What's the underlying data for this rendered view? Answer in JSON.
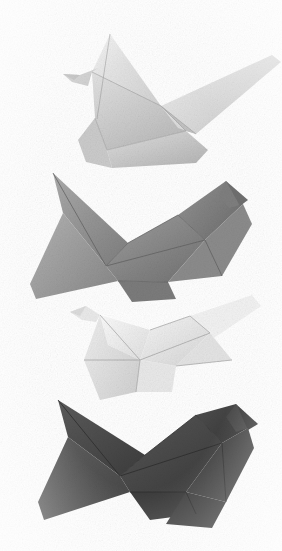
{
  "image": {
    "title": "Four origami paper cranes",
    "subject": "origami-cranes",
    "background_color": "#ffffff",
    "width": 282,
    "height": 551,
    "style": "grainy halftone photographic illustration, grayscale"
  },
  "palette": {
    "background": "#ffffff",
    "crane_light_body": "#d9d9d9",
    "crane_light_shade": "#bdbdbd",
    "crane_light_highlight": "#efefef",
    "crane_mid_body": "#9a9a9a",
    "crane_mid_shade": "#787878",
    "crane_mid_highlight": "#b8b8b8",
    "crane_pale_body": "#f0f0f0",
    "crane_pale_shade": "#d4d4d4",
    "crane_pale_highlight": "#fafafa",
    "crane_dark_body": "#4f4f4f",
    "crane_dark_shade": "#3a3a3a",
    "crane_dark_highlight": "#636363",
    "edge_line": "#8a8a8a",
    "edge_line_dark": "#2e2e2e"
  },
  "cranes": [
    {
      "id": "crane-1",
      "label": "Top light gray origami crane",
      "tone": "light-gray",
      "order": 1,
      "bounds": {
        "x": 60,
        "y": 20,
        "width": 222,
        "height": 150
      },
      "head_direction": "left",
      "body_color": "#d9d9d9",
      "shade_color": "#bdbdbd",
      "highlight_color": "#efefef"
    },
    {
      "id": "crane-2",
      "label": "Second medium gray origami crane",
      "tone": "medium-gray",
      "order": 2,
      "bounds": {
        "x": 28,
        "y": 160,
        "width": 225,
        "height": 150
      },
      "head_direction": "right",
      "body_color": "#9a9a9a",
      "shade_color": "#787878",
      "highlight_color": "#b8b8b8"
    },
    {
      "id": "crane-3",
      "label": "Third pale white origami crane",
      "tone": "near-white",
      "order": 3,
      "bounds": {
        "x": 62,
        "y": 292,
        "width": 200,
        "height": 125
      },
      "head_direction": "left",
      "body_color": "#f0f0f0",
      "shade_color": "#d4d4d4",
      "highlight_color": "#fafafa"
    },
    {
      "id": "crane-4",
      "label": "Bottom dark charcoal origami crane",
      "tone": "dark-charcoal",
      "order": 4,
      "bounds": {
        "x": 34,
        "y": 398,
        "width": 230,
        "height": 153
      },
      "head_direction": "right",
      "body_color": "#4f4f4f",
      "shade_color": "#3a3a3a",
      "highlight_color": "#636363"
    }
  ],
  "counts": {
    "crane_count": 4
  }
}
